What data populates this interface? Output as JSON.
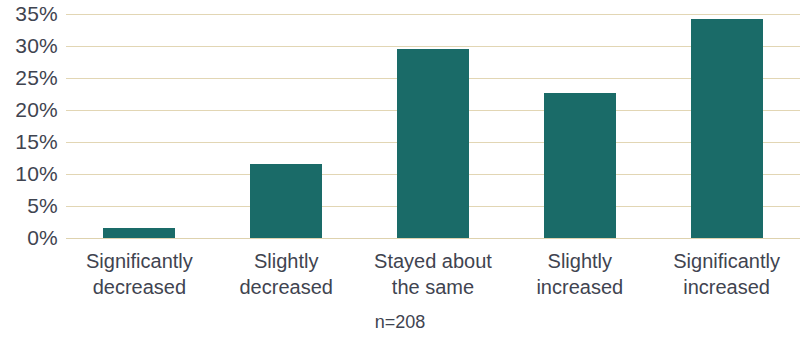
{
  "chart_data": {
    "type": "bar",
    "title": "",
    "subtitle": "",
    "xlabel": "",
    "ylabel": "",
    "categories": [
      "Significantly decreased",
      "Slightly decreased",
      "Stayed about the same",
      "Slightly increased",
      "Significantly increased"
    ],
    "category_lines": [
      [
        "Significantly",
        "decreased"
      ],
      [
        "Slightly",
        "decreased"
      ],
      [
        "Stayed about",
        "the same"
      ],
      [
        "Slightly",
        "increased"
      ],
      [
        "Significantly",
        "increased"
      ]
    ],
    "values": [
      1.5,
      11.6,
      29.5,
      22.7,
      34.2
    ],
    "value_labels": [
      "1.5%",
      "11.6%",
      "29.5%",
      "22.7%",
      "34.2%"
    ],
    "ylim": [
      0,
      35
    ],
    "ytick_values": [
      0,
      5,
      10,
      15,
      20,
      25,
      30,
      35
    ],
    "ytick_labels": [
      "0%",
      "5%",
      "10%",
      "15%",
      "20%",
      "25%",
      "30%",
      "35%"
    ],
    "grid": true,
    "grid_axis": "y",
    "legend": false,
    "legend_position": "none",
    "annotation": "n=208",
    "sample_size": 208,
    "series": [
      {
        "name": "Share of respondents",
        "values": [
          1.5,
          11.6,
          29.5,
          22.7,
          34.2
        ]
      }
    ]
  },
  "colors": {
    "bar": "#1a6b68",
    "gridline": "#e2d6b4",
    "baseline": "#ded2ae",
    "text": "#3f4450",
    "background": "#ffffff"
  }
}
